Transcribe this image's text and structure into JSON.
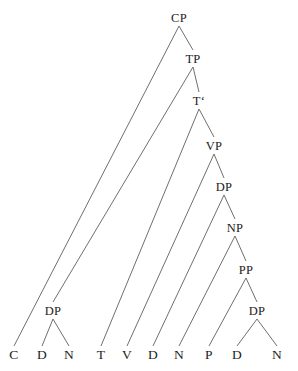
{
  "figure": {
    "kind": "syntax-tree",
    "width": 298,
    "height": 371,
    "background_color": "#ffffff",
    "edge_color": "#6f6f6f",
    "label_color": "#1c1c1c"
  },
  "nodes": {
    "cp": {
      "label": "CP",
      "x": 179,
      "y": 18
    },
    "tp": {
      "label": "TP",
      "x": 193,
      "y": 59
    },
    "tbar": {
      "label": "T‘",
      "x": 199,
      "y": 101
    },
    "vp": {
      "label": "VP",
      "x": 214,
      "y": 146
    },
    "dp_obj": {
      "label": "DP",
      "x": 224,
      "y": 187
    },
    "np": {
      "label": "NP",
      "x": 235,
      "y": 228
    },
    "pp": {
      "label": "PP",
      "x": 246,
      "y": 270
    },
    "dp_low": {
      "label": "DP",
      "x": 257,
      "y": 311
    },
    "dp_subj": {
      "label": "DP",
      "x": 53,
      "y": 311
    },
    "leaf_c": {
      "label": "C",
      "x": 14,
      "y": 355
    },
    "leaf_d1": {
      "label": "D",
      "x": 42,
      "y": 355
    },
    "leaf_n1": {
      "label": "N",
      "x": 69,
      "y": 355
    },
    "leaf_t": {
      "label": "T",
      "x": 101,
      "y": 355
    },
    "leaf_v": {
      "label": "V",
      "x": 127,
      "y": 355
    },
    "leaf_d2": {
      "label": "D",
      "x": 153,
      "y": 355
    },
    "leaf_n2": {
      "label": "N",
      "x": 179,
      "y": 355
    },
    "leaf_p": {
      "label": "P",
      "x": 209,
      "y": 355
    },
    "leaf_d3": {
      "label": "D",
      "x": 237,
      "y": 355
    },
    "leaf_n3": {
      "label": "N",
      "x": 277,
      "y": 355
    }
  },
  "edges": [
    {
      "name": "cp-to-c",
      "from": "cp",
      "to": "leaf_c"
    },
    {
      "name": "cp-to-tp",
      "from": "cp",
      "to": "tp"
    },
    {
      "name": "tp-to-dp-subj",
      "from": "tp",
      "to": "dp_subj"
    },
    {
      "name": "tp-to-tbar",
      "from": "tp",
      "to": "tbar"
    },
    {
      "name": "tbar-to-t",
      "from": "tbar",
      "to": "leaf_t"
    },
    {
      "name": "tbar-to-vp",
      "from": "tbar",
      "to": "vp"
    },
    {
      "name": "vp-to-v",
      "from": "vp",
      "to": "leaf_v"
    },
    {
      "name": "vp-to-dp-obj",
      "from": "vp",
      "to": "dp_obj"
    },
    {
      "name": "dp-obj-to-d",
      "from": "dp_obj",
      "to": "leaf_d2"
    },
    {
      "name": "dp-obj-to-np",
      "from": "dp_obj",
      "to": "np"
    },
    {
      "name": "np-to-n",
      "from": "np",
      "to": "leaf_n2"
    },
    {
      "name": "np-to-pp",
      "from": "np",
      "to": "pp"
    },
    {
      "name": "pp-to-p",
      "from": "pp",
      "to": "leaf_p"
    },
    {
      "name": "pp-to-dp-low",
      "from": "pp",
      "to": "dp_low"
    },
    {
      "name": "dp-low-to-d",
      "from": "dp_low",
      "to": "leaf_d3"
    },
    {
      "name": "dp-low-to-n",
      "from": "dp_low",
      "to": "leaf_n3"
    },
    {
      "name": "dp-subj-to-d",
      "from": "dp_subj",
      "to": "leaf_d1"
    },
    {
      "name": "dp-subj-to-n",
      "from": "dp_subj",
      "to": "leaf_n1"
    }
  ]
}
